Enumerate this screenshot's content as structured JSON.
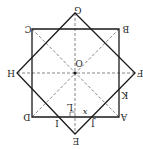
{
  "diagram": {
    "orientation": "rotated 180°",
    "colors": {
      "stroke": "#1a1a1a",
      "dashed": "#666666",
      "background": "#ffffff"
    },
    "square_abcd": {
      "A": [
        119,
        117
      ],
      "B": [
        119,
        29
      ],
      "C": [
        32,
        29
      ],
      "D": [
        32,
        117
      ]
    },
    "square_efgh": {
      "E": [
        75,
        134
      ],
      "F": [
        135,
        73
      ],
      "G": [
        75,
        13
      ],
      "H": [
        17,
        73
      ]
    },
    "center": {
      "O": [
        75,
        73
      ]
    },
    "points": {
      "I": [
        58,
        117
      ],
      "J": [
        92,
        117
      ],
      "K": [
        119,
        89
      ],
      "L": [
        75,
        117
      ]
    },
    "labels": {
      "A": "A",
      "B": "B",
      "C": "C",
      "D": "D",
      "E": "E",
      "F": "F",
      "G": "G",
      "H": "H",
      "I": "I",
      "J": "J",
      "K": "K",
      "L": "L",
      "O": "O",
      "x": "x"
    }
  }
}
